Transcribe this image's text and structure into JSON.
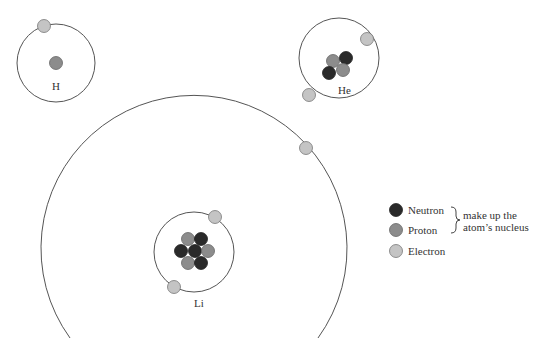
{
  "diagram": {
    "type": "atomic-models",
    "colors": {
      "neutron": "#2a2a2a",
      "proton": "#8c8c8c",
      "electron": "#c4c4c4",
      "orbit": "#555555"
    },
    "atoms": [
      {
        "symbol": "H",
        "protons": 1,
        "neutrons": 0,
        "electrons": 1
      },
      {
        "symbol": "He",
        "protons": 2,
        "neutrons": 2,
        "electrons": 2
      },
      {
        "symbol": "Li",
        "protons": 3,
        "neutrons": 4,
        "electrons": 3
      }
    ],
    "legend": {
      "items": [
        {
          "label": "Neutron"
        },
        {
          "label": "Proton"
        },
        {
          "label": "Electron"
        }
      ],
      "brace_note_line1": "make up the",
      "brace_note_line2": "atom’s nucleus"
    }
  }
}
